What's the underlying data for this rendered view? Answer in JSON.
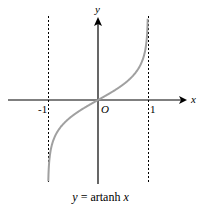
{
  "chart_data": {
    "type": "line",
    "title": "y = artanh x",
    "xlabel": "x",
    "ylabel": "y",
    "origin_label": "O",
    "x_ticks": [
      -1,
      1
    ],
    "x_tick_labels": [
      "-1",
      "1"
    ],
    "asymptotes": [
      -1,
      1
    ],
    "xlim": [
      -1.9,
      1.9
    ],
    "grid": false,
    "series": [
      {
        "name": "artanh x",
        "x": [
          -0.995,
          -0.99,
          -0.95,
          -0.9,
          -0.75,
          -0.5,
          -0.25,
          0,
          0.25,
          0.5,
          0.75,
          0.9,
          0.95,
          0.99,
          0.995
        ],
        "values": [
          -2.99,
          -2.65,
          -1.83,
          -1.47,
          -0.97,
          -0.55,
          -0.26,
          0,
          0.26,
          0.55,
          0.97,
          1.47,
          1.83,
          2.65,
          2.99
        ]
      }
    ]
  },
  "labels": {
    "x_axis": "x",
    "y_axis": "y",
    "origin": "O",
    "tick_neg1": "-1",
    "tick_pos1": "1",
    "caption_y": "y",
    "caption_eq": " = artanh ",
    "caption_x": "x"
  },
  "colors": {
    "curve": "#a0a0a0",
    "axes": "#000000"
  }
}
